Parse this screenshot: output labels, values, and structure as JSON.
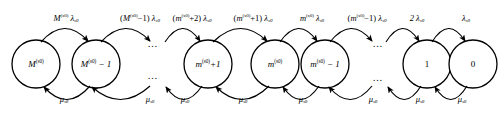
{
  "diagram": {
    "type": "state-transition-chain",
    "stroke_color": "#000000",
    "background_color": "#ffffff",
    "nodes": [
      {
        "id": "n0",
        "cx": 36,
        "cy": 64,
        "r": 24,
        "base": "M",
        "sup": "(s0)",
        "suffix": "",
        "italic": true
      },
      {
        "id": "n1",
        "cx": 96,
        "cy": 64,
        "r": 24,
        "base": "M",
        "sup": "(s0)",
        "suffix": " − 1",
        "italic": true
      },
      {
        "id": "n2",
        "cx": 208,
        "cy": 64,
        "r": 24,
        "base": "m",
        "sup": "(s0)",
        "suffix": "+1",
        "italic": true
      },
      {
        "id": "n3",
        "cx": 275,
        "cy": 64,
        "r": 24,
        "base": "m",
        "sup": "(s0)",
        "suffix": "",
        "italic": true
      },
      {
        "id": "n4",
        "cx": 325,
        "cy": 64,
        "r": 24,
        "base": "m",
        "sup": "(s0)",
        "suffix": " − 1",
        "italic": true
      },
      {
        "id": "n5",
        "cx": 427,
        "cy": 64,
        "r": 24,
        "base": "1",
        "sup": "",
        "suffix": "",
        "italic": false
      },
      {
        "id": "n6",
        "cx": 473,
        "cy": 64,
        "r": 24,
        "base": "0",
        "sup": "",
        "suffix": "",
        "italic": false
      }
    ],
    "arrivals": [
      {
        "id": "a0",
        "x": 66,
        "y": 18,
        "coef_open": "",
        "base": "M",
        "sup": "(s0)",
        "coef_close": "",
        "rate": "λ",
        "rate_sub": "s0"
      },
      {
        "id": "a1",
        "x": 140,
        "y": 18,
        "coef_open": "(",
        "base": "M",
        "sup": "(s0)",
        "coef_close": "−1)",
        "rate": "λ",
        "rate_sub": "s0"
      },
      {
        "id": "a2",
        "x": 192,
        "y": 18,
        "coef_open": "(",
        "base": "m",
        "sup": "(s0)",
        "coef_close": "+2)",
        "rate": "λ",
        "rate_sub": "s0"
      },
      {
        "id": "a3",
        "x": 253,
        "y": 18,
        "coef_open": "(",
        "base": "m",
        "sup": "(s0)",
        "coef_close": "+1)",
        "rate": "λ",
        "rate_sub": "s0"
      },
      {
        "id": "a4",
        "x": 312,
        "y": 18,
        "coef_open": "",
        "base": "m",
        "sup": "(s0)",
        "coef_close": "",
        "rate": "λ",
        "rate_sub": "s0"
      },
      {
        "id": "a5",
        "x": 367,
        "y": 18,
        "coef_open": "(",
        "base": "m",
        "sup": "(s0)",
        "coef_close": "−1)",
        "rate": "λ",
        "rate_sub": "s0"
      },
      {
        "id": "a6",
        "x": 417,
        "y": 18,
        "coef_open": "",
        "base": "2",
        "sup": "",
        "coef_close": "",
        "rate": "λ",
        "rate_sub": "s0"
      },
      {
        "id": "a7",
        "x": 466,
        "y": 18,
        "coef_open": "",
        "base": "",
        "sup": "",
        "coef_close": "",
        "rate": "λ",
        "rate_sub": "s0"
      }
    ],
    "departures": [
      {
        "id": "d0",
        "x": 64,
        "y": 99,
        "rate": "μ",
        "rate_sub": "s0"
      },
      {
        "id": "d1",
        "x": 150,
        "y": 99,
        "rate": "μ",
        "rate_sub": "s0"
      },
      {
        "id": "d2",
        "x": 185,
        "y": 99,
        "rate": "μ",
        "rate_sub": "s0"
      },
      {
        "id": "d3",
        "x": 243,
        "y": 99,
        "rate": "μ",
        "rate_sub": "s0"
      },
      {
        "id": "d4",
        "x": 303,
        "y": 99,
        "rate": "μ",
        "rate_sub": "s0"
      },
      {
        "id": "d5",
        "x": 373,
        "y": 99,
        "rate": "μ",
        "rate_sub": "s0"
      },
      {
        "id": "d6",
        "x": 420,
        "y": 99,
        "rate": "μ",
        "rate_sub": "s0"
      },
      {
        "id": "d7",
        "x": 462,
        "y": 99,
        "rate": "μ",
        "rate_sub": "s0"
      }
    ],
    "ellipses": [
      {
        "id": "e-top-left",
        "x": 153,
        "y": 44,
        "glyph": "…"
      },
      {
        "id": "e-bot-left",
        "x": 153,
        "y": 76,
        "glyph": "…"
      },
      {
        "id": "e-top-right",
        "x": 378,
        "y": 44,
        "glyph": "…"
      },
      {
        "id": "e-bot-right",
        "x": 378,
        "y": 78,
        "glyph": "…"
      }
    ]
  }
}
